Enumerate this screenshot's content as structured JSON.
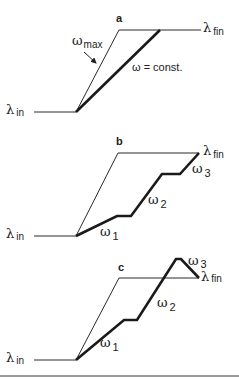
{
  "figure": {
    "panels": [
      {
        "id": "a",
        "letter": "a",
        "lambda_in": "λ",
        "lambda_in_sub": "in",
        "lambda_fin": "λ",
        "lambda_fin_sub": "fin",
        "omega_max": "ω",
        "omega_max_sub": "max",
        "omega_const": "ω = const."
      },
      {
        "id": "b",
        "letter": "b",
        "lambda_in": "λ",
        "lambda_in_sub": "in",
        "lambda_fin": "λ",
        "lambda_fin_sub": "fin",
        "omegas": [
          {
            "sym": "ω",
            "sub": "1"
          },
          {
            "sym": "ω",
            "sub": "2"
          },
          {
            "sym": "ω",
            "sub": "3"
          }
        ]
      },
      {
        "id": "c",
        "letter": "c",
        "lambda_in": "λ",
        "lambda_in_sub": "in",
        "lambda_fin": "λ",
        "lambda_fin_sub": "fin",
        "omegas": [
          {
            "sym": "ω",
            "sub": "1"
          },
          {
            "sym": "ω",
            "sub": "2"
          },
          {
            "sym": "ω",
            "sub": "3"
          }
        ]
      }
    ]
  }
}
